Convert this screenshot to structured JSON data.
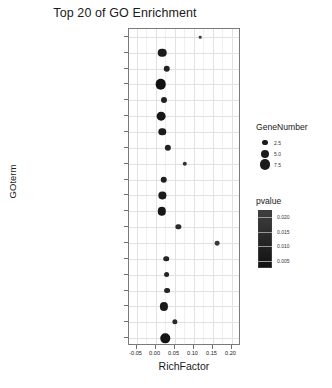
{
  "chart_data": {
    "type": "scatter",
    "title": "Top 20 of GO Enrichment",
    "xlabel": "RichFactor",
    "ylabel": "GOterm",
    "xlim": [
      -0.07,
      0.225
    ],
    "xticks": [
      -0.05,
      0.0,
      0.05,
      0.1,
      0.15,
      0.2
    ],
    "xtick_labels": [
      "-0.05",
      "0.00",
      "0.05",
      "0.10",
      "0.15",
      "0.20"
    ],
    "grid": true,
    "legend_position": "right",
    "categories": [
      "death-inducing signaling complex",
      "lytic vacuole",
      "lipid droplet",
      "mitochondrion",
      "azurophil granule",
      "cytoskeleton",
      "secretory granule lumen",
      "azurophil granule lumen",
      "endosome lumen",
      "ficolin-1-rich granule",
      "lysosome",
      "endolysosome",
      "vacuolar lumen",
      "invadopodium",
      "ficolin-1-rich granule lumen",
      "membrane raft",
      "mitochondrial outer membrane",
      "perinuclear region of cytoplasm",
      "caveola",
      "focal adhesion"
    ],
    "points": [
      {
        "term": "death-inducing signaling complex",
        "rich_factor": 0.118,
        "gene_number": 1.0,
        "pvalue": 0.0225
      },
      {
        "term": "lytic vacuole",
        "rich_factor": 0.018,
        "gene_number": 5.6,
        "pvalue": 0.01
      },
      {
        "term": "lipid droplet",
        "rich_factor": 0.03,
        "gene_number": 3.6,
        "pvalue": 0.012
      },
      {
        "term": "mitochondrion",
        "rich_factor": 0.013,
        "gene_number": 8.0,
        "pvalue": 0.006
      },
      {
        "term": "azurophil granule",
        "rich_factor": 0.022,
        "gene_number": 3.2,
        "pvalue": 0.012
      },
      {
        "term": "cytoskeleton",
        "rich_factor": 0.014,
        "gene_number": 5.8,
        "pvalue": 0.008
      },
      {
        "term": "secretory granule lumen",
        "rich_factor": 0.018,
        "gene_number": 4.4,
        "pvalue": 0.01
      },
      {
        "term": "azurophil granule lumen",
        "rich_factor": 0.032,
        "gene_number": 3.4,
        "pvalue": 0.0125
      },
      {
        "term": "endosome lumen",
        "rich_factor": 0.077,
        "gene_number": 2.0,
        "pvalue": 0.018
      },
      {
        "term": "ficolin-1-rich granule",
        "rich_factor": 0.022,
        "gene_number": 3.6,
        "pvalue": 0.011
      },
      {
        "term": "lysosome",
        "rich_factor": 0.018,
        "gene_number": 4.2,
        "pvalue": 0.01
      },
      {
        "term": "endolysosome",
        "rich_factor": 0.016,
        "gene_number": 5.4,
        "pvalue": 0.0085
      },
      {
        "term": "vacuolar lumen",
        "rich_factor": 0.06,
        "gene_number": 2.6,
        "pvalue": 0.0155
      },
      {
        "term": "invadopodium",
        "rich_factor": 0.163,
        "gene_number": 2.2,
        "pvalue": 0.02
      },
      {
        "term": "ficolin-1-rich granule lumen",
        "rich_factor": 0.028,
        "gene_number": 2.8,
        "pvalue": 0.013
      },
      {
        "term": "membrane raft",
        "rich_factor": 0.029,
        "gene_number": 3.0,
        "pvalue": 0.013
      },
      {
        "term": "mitochondrial outer membrane",
        "rich_factor": 0.03,
        "gene_number": 3.0,
        "pvalue": 0.0135
      },
      {
        "term": "perinuclear region of cytoplasm",
        "rich_factor": 0.022,
        "gene_number": 5.2,
        "pvalue": 0.0095
      },
      {
        "term": "caveola",
        "rich_factor": 0.05,
        "gene_number": 2.6,
        "pvalue": 0.015
      },
      {
        "term": "focal adhesion",
        "rich_factor": 0.026,
        "gene_number": 6.6,
        "pvalue": 0.0075
      }
    ],
    "size_legend": {
      "title": "GeneNumber",
      "values": [
        "2.5",
        "5.0",
        "7.5"
      ]
    },
    "color_legend": {
      "title": "pvalue",
      "ticks": [
        "0.020",
        "0.015",
        "0.010",
        "0.005"
      ],
      "high_color": "#3f3f3f",
      "low_color": "#111111"
    },
    "point_color": "#1b1b1b"
  }
}
